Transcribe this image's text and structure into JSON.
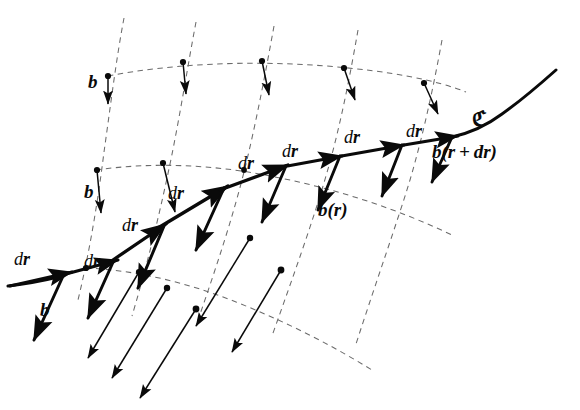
{
  "figure": {
    "background_color": "#ffffff",
    "ink_color": "#0a0a0a",
    "grid_color": "#6e6e6e",
    "width": 580,
    "height": 410
  },
  "labels": {
    "curve_name": "ℭ",
    "field_at_r": "b(r)",
    "field_at_r_plus_dr": "b(r + dr)",
    "d": "d",
    "r": "r",
    "b": "b",
    "dr_upright": "d",
    "dr_bold": "r"
  },
  "annotations": [
    {
      "id": "b-top-left",
      "text": "b",
      "kind": "field",
      "x": 88,
      "y": 80
    },
    {
      "id": "b-mid-left",
      "text": "b",
      "kind": "field",
      "x": 82,
      "y": 188
    },
    {
      "id": "b-bottom-left",
      "text": "b",
      "kind": "field",
      "x": 38,
      "y": 305
    },
    {
      "id": "b-of-r",
      "text": "b(r)",
      "kind": "field",
      "x": 318,
      "y": 205
    },
    {
      "id": "b-of-r-plus-dr",
      "text": "b(r + dr)",
      "kind": "field",
      "x": 434,
      "y": 148
    },
    {
      "id": "curve-C",
      "text": "ℭ",
      "kind": "curve",
      "x": 476,
      "y": 112
    },
    {
      "id": "dr-1",
      "text": "dr",
      "kind": "increment",
      "x": 16,
      "y": 256
    },
    {
      "id": "dr-2",
      "text": "dr",
      "kind": "increment",
      "x": 86,
      "y": 258
    },
    {
      "id": "dr-3",
      "text": "dr",
      "kind": "increment",
      "x": 124,
      "y": 222
    },
    {
      "id": "dr-4",
      "text": "dr",
      "kind": "increment",
      "x": 168,
      "y": 190
    },
    {
      "id": "dr-5",
      "text": "dr",
      "kind": "increment",
      "x": 238,
      "y": 160
    },
    {
      "id": "dr-6",
      "text": "dr",
      "kind": "increment",
      "x": 280,
      "y": 148
    },
    {
      "id": "dr-7",
      "text": "dr",
      "kind": "increment",
      "x": 340,
      "y": 136
    },
    {
      "id": "dr-8",
      "text": "dr",
      "kind": "increment",
      "x": 404,
      "y": 130
    }
  ],
  "geometry": {
    "curve_C": {
      "description": "Bold polyline path of the curve C traversed by successive dr increments",
      "path": "M 8 285 C 22 283 40 280 62 274 L 108 258",
      "segments": [
        {
          "from": [
            8,
            285
          ],
          "to": [
            68,
            272
          ],
          "label": "dr-1"
        },
        {
          "from": [
            68,
            272
          ],
          "to": [
            112,
            258
          ],
          "label": "dr-2"
        },
        {
          "from": [
            112,
            258
          ],
          "to": [
            162,
            222
          ],
          "label": "dr-3"
        },
        {
          "from": [
            162,
            222
          ],
          "to": [
            222,
            186
          ],
          "label": "dr-4"
        },
        {
          "from": [
            222,
            186
          ],
          "to": [
            282,
            164
          ],
          "label": "dr-5"
        },
        {
          "from": [
            282,
            164
          ],
          "to": [
            336,
            155
          ],
          "label": "dr-6"
        },
        {
          "from": [
            336,
            155
          ],
          "to": [
            398,
            143
          ],
          "label": "dr-7"
        },
        {
          "from": [
            398,
            143
          ],
          "to": [
            452,
            137
          ],
          "label": "dr-8"
        }
      ],
      "tail_extension": "M 470 130 C 500 120 524 104 552 84"
    },
    "field_line_count": 5,
    "transversal_count": 3,
    "field_vectors_on_curve": 8,
    "top_row_vectors": 5,
    "bottom_row_vectors": 4
  }
}
